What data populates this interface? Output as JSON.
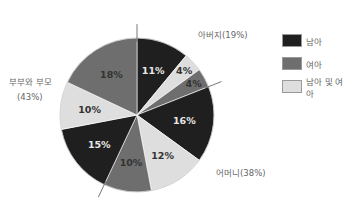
{
  "chart_data": {
    "type": "pie",
    "title": "",
    "center": [
      137,
      115
    ],
    "radius": 77,
    "start_angle_deg": 0,
    "direction": "clockwise",
    "slices": [
      {
        "label": "11%",
        "value": 11,
        "series": "남아",
        "group": "아버지"
      },
      {
        "label": "4%",
        "value": 4,
        "series": "남아 및 여아",
        "group": "아버지"
      },
      {
        "label": "4%",
        "value": 4,
        "series": "여아",
        "group": "아버지"
      },
      {
        "label": "16%",
        "value": 16,
        "series": "남아",
        "group": "어머니"
      },
      {
        "label": "12%",
        "value": 12,
        "series": "남아 및 여아",
        "group": "어머니"
      },
      {
        "label": "10%",
        "value": 10,
        "series": "여아",
        "group": "어머니"
      },
      {
        "label": "15%",
        "value": 15,
        "series": "남아",
        "group": "부부와 부모"
      },
      {
        "label": "10%",
        "value": 10,
        "series": "남아 및 여아",
        "group": "부부와 부모"
      },
      {
        "label": "18%",
        "value": 18,
        "series": "여아",
        "group": "부부와 부모"
      }
    ],
    "groups": [
      {
        "name": "아버지",
        "label": "아버지(19%)",
        "value": 19
      },
      {
        "name": "어머니",
        "label": "어머니(38%)",
        "value": 38
      },
      {
        "name": "부부와 부모",
        "label": "부부와 부모",
        "label2": "(43%)",
        "value": 43
      }
    ],
    "legend": [
      {
        "label": "남아",
        "color": "#1f1f1f"
      },
      {
        "label": "여아",
        "color": "#6e6e6e"
      },
      {
        "label": "남아 및 여아",
        "color": "#dedede"
      }
    ],
    "legend_position": "right"
  },
  "colors": {
    "남아": "#1f1f1f",
    "여아": "#6e6e6e",
    "남아 및 여아": "#dedede"
  }
}
